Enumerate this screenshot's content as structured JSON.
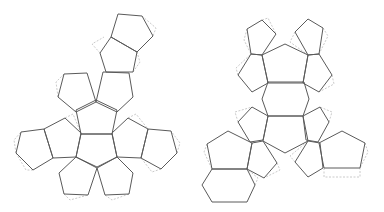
{
  "diagram": {
    "colors": {
      "face_stroke": "#5a5a5a",
      "tab_stroke": "#bdbdbd",
      "background": "#ffffff"
    },
    "nets": [
      {
        "name": "left-net",
        "faces": [
          {
            "shape": "pentagon",
            "points": "118,14 142,16 153,36 137,52 111,37"
          },
          {
            "shape": "pentagon",
            "points": "111,37 137,52 133,72 106,72 100,53"
          },
          {
            "shape": "pentagon",
            "points": "64,74 87,73 96,102 76,112 58,97"
          },
          {
            "shape": "pentagon",
            "points": "103,72 129,73 133,97 117,112 96,102"
          },
          {
            "shape": "pentagon",
            "points": "96,100 117,110 112,134 81,134 76,110"
          },
          {
            "shape": "pentagon",
            "points": "81,134 112,134 117,157 97,167 76,157"
          },
          {
            "shape": "pentagon",
            "points": "21,132 44,129 53,158 33,170 16,153"
          },
          {
            "shape": "pentagon",
            "points": "44,129 65,118 81,133 76,157 53,158"
          },
          {
            "shape": "pentagon",
            "points": "112,133 128,118 148,129 141,158 117,157"
          },
          {
            "shape": "pentagon",
            "points": "148,129 171,131 177,153 161,169 141,158"
          },
          {
            "shape": "pentagon",
            "points": "76,157 97,168 88,195 64,194 59,173"
          },
          {
            "shape": "pentagon",
            "points": "97,168 117,157 133,173 129,194 105,195"
          }
        ],
        "tabs": [
          "142,16 156,28 153,36",
          "100,53 92,44 104,37",
          "133,72 140,62 137,52",
          "58,97 56,82 64,74",
          "16,153 14,140 21,132",
          "33,170 26,170 16,153",
          "177,153 180,143 171,131",
          "161,169 152,172 141,158",
          "64,194 70,200 88,195",
          "105,195 112,200 129,194",
          "65,118 73,114 81,133",
          "128,118 136,114 148,129"
        ]
      },
      {
        "name": "right-net",
        "faces": [
          {
            "shape": "pentagon",
            "points": "247,29 262,20 276,34 262,55 251,54"
          },
          {
            "shape": "pentagon",
            "points": "295,32 308,19 323,28 319,54 308,55"
          },
          {
            "shape": "pentagon",
            "points": "262,55 285,44 308,55 303,83 268,83"
          },
          {
            "shape": "pentagon",
            "points": "251,54 262,55 268,83 252,92 238,75"
          },
          {
            "shape": "pentagon",
            "points": "308,55 319,54 332,75 319,92 303,83"
          },
          {
            "shape": "hexagon",
            "points": "268,82 304,82 309,99 303,116 268,116 262,99"
          },
          {
            "shape": "pentagon",
            "points": "252,107 268,116 263,140 250,142 238,122"
          },
          {
            "shape": "pentagon",
            "points": "303,116 320,107 329,122 318,142 306,140"
          },
          {
            "shape": "hexagon",
            "points": "268,116 303,116 308,141 285,153 263,141"
          },
          {
            "shape": "pentagon",
            "points": "207,144 228,131 252,143 247,169 212,169"
          },
          {
            "shape": "hexagon",
            "points": "212,169 247,169 255,185 247,202 212,202 202,185"
          },
          {
            "shape": "pentagon",
            "points": "252,143 263,141 277,163 264,178 247,169"
          },
          {
            "shape": "pentagon",
            "points": "308,141 320,143 323,168 308,177 295,162"
          },
          {
            "shape": "pentagon",
            "points": "319,143 342,131 365,143 360,168 324,168"
          }
        ],
        "tabs": [
          "247,29 244,40 251,54",
          "262,20 268,18 276,34",
          "295,32 290,42 308,55",
          "323,28 328,36 319,54",
          "238,75 236,68 251,54",
          "332,75 334,84 319,92",
          "238,122 235,112 252,107",
          "329,122 332,112 320,107",
          "207,144 204,152 212,169",
          "277,163 280,170 264,178",
          "295,162 290,156 308,141",
          "365,143 368,152 360,168",
          "324,168 324,177 360,177 360,168",
          "255,185 258,178 247,169"
        ]
      }
    ]
  }
}
